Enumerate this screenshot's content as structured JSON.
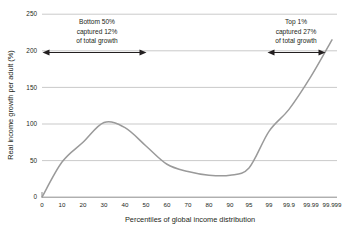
{
  "chart_data": {
    "type": "line",
    "title": "",
    "xlabel": "Percentiles of global income distribution",
    "ylabel": "Real income growth per adult (%)",
    "categories": [
      "0",
      "10",
      "20",
      "30",
      "40",
      "50",
      "60",
      "70",
      "80",
      "90",
      "95",
      "99",
      "99.9",
      "99.99",
      "99.999"
    ],
    "values": [
      0,
      48,
      75,
      102,
      95,
      70,
      45,
      35,
      30,
      30,
      40,
      90,
      120,
      165,
      215
    ],
    "series": [
      {
        "name": "Real income growth per adult",
        "values": [
          0,
          48,
          75,
          102,
          95,
          70,
          45,
          35,
          30,
          30,
          40,
          90,
          120,
          165,
          215
        ]
      }
    ],
    "yticks": [
      "0",
      "50",
      "100",
      "150",
      "200",
      "250"
    ],
    "ylim": [
      0,
      250
    ],
    "grid": true,
    "legend_position": "none",
    "line_color": "#9a9a9a",
    "annotations": [
      {
        "id": "bottom-50",
        "lines": [
          "Bottom 50%",
          "captured 12%",
          "of total growth"
        ],
        "arrow_y_value": 200,
        "arrow_start_category": "0",
        "arrow_end_category": "50"
      },
      {
        "id": "top-1",
        "lines": [
          "Top 1%",
          "captured 27%",
          "of total growth"
        ],
        "arrow_y_value": 200,
        "arrow_start_category": "99",
        "arrow_end_category": "99.999"
      }
    ]
  }
}
